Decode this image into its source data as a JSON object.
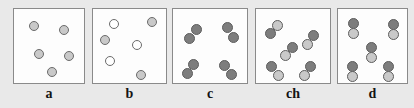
{
  "figure": {
    "background_color": "#e9e9e9",
    "panel_background": "#fdfdfd",
    "panel_border_color": "#8a8a8a",
    "label_font_size_px": 14
  },
  "colors": {
    "light_gray_particle": "#c9c9c9",
    "dark_gray_particle": "#7d7d7d",
    "white_particle": "#ffffff",
    "particle_outline": "#6b6b6b",
    "label_text": "#141414"
  },
  "panels": [
    {
      "id": "panel-a",
      "label": "a",
      "box": {
        "x": 13,
        "y": 8,
        "w": 72,
        "h": 76
      },
      "label_pos": {
        "x": 13,
        "y": 86,
        "w": 72
      },
      "description": "five separate light gray single atoms",
      "particle_count": 5,
      "particles": [
        {
          "name": "particle-light",
          "cx": 20,
          "cy": 17,
          "r": 5.0,
          "fill": "#c9c9c9",
          "stroke": "#6b6b6b"
        },
        {
          "name": "particle-light",
          "cx": 50,
          "cy": 21,
          "r": 5.0,
          "fill": "#c9c9c9",
          "stroke": "#6b6b6b"
        },
        {
          "name": "particle-light",
          "cx": 25,
          "cy": 45,
          "r": 5.0,
          "fill": "#c9c9c9",
          "stroke": "#6b6b6b"
        },
        {
          "name": "particle-light",
          "cx": 55,
          "cy": 47,
          "r": 5.0,
          "fill": "#c9c9c9",
          "stroke": "#6b6b6b"
        },
        {
          "name": "particle-light",
          "cx": 38,
          "cy": 63,
          "r": 5.0,
          "fill": "#c9c9c9",
          "stroke": "#6b6b6b"
        }
      ]
    },
    {
      "id": "panel-b",
      "label": "b",
      "box": {
        "x": 92,
        "y": 8,
        "w": 75,
        "h": 76
      },
      "label_pos": {
        "x": 92,
        "y": 86,
        "w": 75
      },
      "description": "mixture of three white and three gray single atoms",
      "particle_count": 6,
      "particles": [
        {
          "name": "particle-white",
          "cx": 21,
          "cy": 15,
          "r": 5.0,
          "fill": "#ffffff",
          "stroke": "#6b6b6b"
        },
        {
          "name": "particle-gray",
          "cx": 59,
          "cy": 13,
          "r": 5.0,
          "fill": "#c9c9c9",
          "stroke": "#6b6b6b"
        },
        {
          "name": "particle-gray",
          "cx": 12,
          "cy": 31,
          "r": 5.0,
          "fill": "#c9c9c9",
          "stroke": "#6b6b6b"
        },
        {
          "name": "particle-white",
          "cx": 44,
          "cy": 36,
          "r": 5.0,
          "fill": "#ffffff",
          "stroke": "#6b6b6b"
        },
        {
          "name": "particle-white",
          "cx": 17,
          "cy": 52,
          "r": 5.0,
          "fill": "#ffffff",
          "stroke": "#6b6b6b"
        },
        {
          "name": "particle-gray",
          "cx": 48,
          "cy": 66,
          "r": 5.0,
          "fill": "#c9c9c9",
          "stroke": "#6b6b6b"
        }
      ]
    },
    {
      "id": "panel-c",
      "label": "c",
      "box": {
        "x": 172,
        "y": 8,
        "w": 76,
        "h": 76
      },
      "label_pos": {
        "x": 172,
        "y": 86,
        "w": 76
      },
      "description": "four diatomic molecules of two identical dark gray atoms",
      "molecule_count": 4,
      "particles": [
        {
          "name": "particle-dark",
          "cx": 23,
          "cy": 20,
          "r": 5.5,
          "fill": "#7d7d7d",
          "stroke": "#5d5d5d"
        },
        {
          "name": "particle-dark",
          "cx": 16,
          "cy": 29,
          "r": 5.5,
          "fill": "#7d7d7d",
          "stroke": "#5d5d5d"
        },
        {
          "name": "particle-dark",
          "cx": 54,
          "cy": 18,
          "r": 5.5,
          "fill": "#7d7d7d",
          "stroke": "#5d5d5d"
        },
        {
          "name": "particle-dark",
          "cx": 60,
          "cy": 28,
          "r": 5.5,
          "fill": "#7d7d7d",
          "stroke": "#5d5d5d"
        },
        {
          "name": "particle-dark",
          "cx": 20,
          "cy": 55,
          "r": 5.5,
          "fill": "#7d7d7d",
          "stroke": "#5d5d5d"
        },
        {
          "name": "particle-dark",
          "cx": 14,
          "cy": 64,
          "r": 5.5,
          "fill": "#7d7d7d",
          "stroke": "#5d5d5d"
        },
        {
          "name": "particle-dark",
          "cx": 51,
          "cy": 56,
          "r": 5.5,
          "fill": "#7d7d7d",
          "stroke": "#5d5d5d"
        },
        {
          "name": "particle-dark",
          "cx": 58,
          "cy": 65,
          "r": 5.5,
          "fill": "#7d7d7d",
          "stroke": "#5d5d5d"
        }
      ]
    },
    {
      "id": "panel-ch",
      "label": "ch",
      "box": {
        "x": 255,
        "y": 8,
        "w": 76,
        "h": 76
      },
      "label_pos": {
        "x": 255,
        "y": 86,
        "w": 76
      },
      "description": "five diatomic molecules each made of one dark and one light atom, tilted diagonally",
      "molecule_count": 5,
      "particles": [
        {
          "name": "particle-light",
          "cx": 21,
          "cy": 16,
          "r": 5.5,
          "fill": "#c9c9c9",
          "stroke": "#5d5d5d"
        },
        {
          "name": "particle-dark",
          "cx": 14,
          "cy": 24,
          "r": 5.5,
          "fill": "#7d7d7d",
          "stroke": "#5d5d5d"
        },
        {
          "name": "particle-dark",
          "cx": 57,
          "cy": 26,
          "r": 5.5,
          "fill": "#7d7d7d",
          "stroke": "#5d5d5d"
        },
        {
          "name": "particle-light",
          "cx": 51,
          "cy": 35,
          "r": 5.5,
          "fill": "#c9c9c9",
          "stroke": "#5d5d5d"
        },
        {
          "name": "particle-dark",
          "cx": 36,
          "cy": 38,
          "r": 5.5,
          "fill": "#7d7d7d",
          "stroke": "#5d5d5d"
        },
        {
          "name": "particle-light",
          "cx": 29,
          "cy": 46,
          "r": 5.5,
          "fill": "#c9c9c9",
          "stroke": "#5d5d5d"
        },
        {
          "name": "particle-dark",
          "cx": 15,
          "cy": 57,
          "r": 5.5,
          "fill": "#7d7d7d",
          "stroke": "#5d5d5d"
        },
        {
          "name": "particle-light",
          "cx": 22,
          "cy": 66,
          "r": 5.5,
          "fill": "#c9c9c9",
          "stroke": "#5d5d5d"
        },
        {
          "name": "particle-dark",
          "cx": 54,
          "cy": 57,
          "r": 5.5,
          "fill": "#7d7d7d",
          "stroke": "#5d5d5d"
        },
        {
          "name": "particle-light",
          "cx": 48,
          "cy": 66,
          "r": 5.5,
          "fill": "#c9c9c9",
          "stroke": "#5d5d5d"
        }
      ]
    },
    {
      "id": "panel-d",
      "label": "d",
      "box": {
        "x": 337,
        "y": 8,
        "w": 71,
        "h": 76
      },
      "label_pos": {
        "x": 337,
        "y": 86,
        "w": 71
      },
      "description": "five diatomic molecules each made of one dark and one light atom, stacked vertically",
      "molecule_count": 5,
      "particles": [
        {
          "name": "particle-dark",
          "cx": 15,
          "cy": 14,
          "r": 5.5,
          "fill": "#7d7d7d",
          "stroke": "#5d5d5d"
        },
        {
          "name": "particle-light",
          "cx": 15,
          "cy": 24,
          "r": 5.5,
          "fill": "#c9c9c9",
          "stroke": "#5d5d5d"
        },
        {
          "name": "particle-dark",
          "cx": 55,
          "cy": 15,
          "r": 5.5,
          "fill": "#7d7d7d",
          "stroke": "#5d5d5d"
        },
        {
          "name": "particle-light",
          "cx": 55,
          "cy": 25,
          "r": 5.5,
          "fill": "#c9c9c9",
          "stroke": "#5d5d5d"
        },
        {
          "name": "particle-dark",
          "cx": 33,
          "cy": 38,
          "r": 5.5,
          "fill": "#7d7d7d",
          "stroke": "#5d5d5d"
        },
        {
          "name": "particle-light",
          "cx": 33,
          "cy": 48,
          "r": 5.5,
          "fill": "#c9c9c9",
          "stroke": "#5d5d5d"
        },
        {
          "name": "particle-dark",
          "cx": 14,
          "cy": 57,
          "r": 5.5,
          "fill": "#7d7d7d",
          "stroke": "#5d5d5d"
        },
        {
          "name": "particle-light",
          "cx": 14,
          "cy": 67,
          "r": 5.5,
          "fill": "#c9c9c9",
          "stroke": "#5d5d5d"
        },
        {
          "name": "particle-dark",
          "cx": 50,
          "cy": 57,
          "r": 5.5,
          "fill": "#7d7d7d",
          "stroke": "#5d5d5d"
        },
        {
          "name": "particle-light",
          "cx": 50,
          "cy": 67,
          "r": 5.5,
          "fill": "#c9c9c9",
          "stroke": "#5d5d5d"
        }
      ]
    }
  ]
}
